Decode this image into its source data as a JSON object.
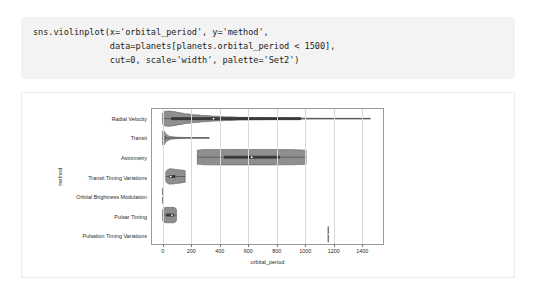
{
  "code_cell": {
    "lines": [
      "sns.violinplot(x='orbital_period', y='method',",
      "               data=planets[planets.orbital_period < 1500],",
      "               cut=0, scale='width', palette='Set2')"
    ]
  },
  "chart_data": {
    "type": "violin",
    "title": "",
    "xlabel": "orbital_period",
    "ylabel": "method",
    "xlim": [
      -75,
      1560
    ],
    "xticks": [
      0,
      200,
      400,
      600,
      800,
      1000,
      1200,
      1400
    ],
    "xtick_labels": [
      "0",
      "200",
      "400",
      "600",
      "800",
      "1000",
      "1200",
      "1400"
    ],
    "grid": "vertical",
    "legend": "none",
    "orientation": "horizontal",
    "scale": "width",
    "cut": 0,
    "palette": "Set2",
    "categories": [
      "Radial Velocity",
      "Transit",
      "Astrometry",
      "Transit Timing Variations",
      "Orbital Brightness Modulation",
      "Pulsar Timing",
      "Pulsation Timing Variations"
    ],
    "violins": [
      {
        "category": "Radial Velocity",
        "color": "#8f8f8f",
        "min": 0,
        "max": 1470,
        "q1": 60,
        "median": 360,
        "q3": 980,
        "profile": [
          [
            0,
            0.72
          ],
          [
            20,
            0.96
          ],
          [
            45,
            1.0
          ],
          [
            80,
            0.92
          ],
          [
            120,
            0.78
          ],
          [
            170,
            0.62
          ],
          [
            230,
            0.5
          ],
          [
            300,
            0.4
          ],
          [
            380,
            0.31
          ],
          [
            470,
            0.23
          ],
          [
            560,
            0.17
          ],
          [
            660,
            0.13
          ],
          [
            780,
            0.1
          ],
          [
            900,
            0.08
          ],
          [
            1040,
            0.06
          ],
          [
            1180,
            0.045
          ],
          [
            1320,
            0.03
          ],
          [
            1400,
            0.022
          ],
          [
            1470,
            0.012
          ]
        ]
      },
      {
        "category": "Transit",
        "color": "#8f8f8f",
        "min": 0,
        "max": 330,
        "q1": 4,
        "median": 9,
        "q3": 22,
        "profile": [
          [
            0,
            0.86
          ],
          [
            5,
            1.0
          ],
          [
            12,
            0.84
          ],
          [
            22,
            0.58
          ],
          [
            34,
            0.36
          ],
          [
            50,
            0.22
          ],
          [
            70,
            0.15
          ],
          [
            100,
            0.1
          ],
          [
            140,
            0.07
          ],
          [
            190,
            0.05
          ],
          [
            250,
            0.035
          ],
          [
            300,
            0.022
          ],
          [
            330,
            0.012
          ]
        ]
      },
      {
        "category": "Astrometry",
        "color": "#8f8f8f",
        "min": 246,
        "max": 1016,
        "q1": 435,
        "median": 631,
        "q3": 830,
        "profile": [
          [
            246,
            0.92
          ],
          [
            300,
            0.99
          ],
          [
            400,
            1.0
          ],
          [
            520,
            1.0
          ],
          [
            650,
            1.0
          ],
          [
            780,
            1.0
          ],
          [
            900,
            0.99
          ],
          [
            980,
            0.95
          ],
          [
            1016,
            0.9
          ]
        ]
      },
      {
        "category": "Transit Timing Variations",
        "color": "#8f8f8f",
        "min": 22,
        "max": 160,
        "q1": 45,
        "median": 57,
        "q3": 90,
        "profile": [
          [
            22,
            0.62
          ],
          [
            35,
            0.88
          ],
          [
            50,
            1.0
          ],
          [
            70,
            0.98
          ],
          [
            95,
            0.92
          ],
          [
            120,
            0.86
          ],
          [
            145,
            0.8
          ],
          [
            160,
            0.76
          ]
        ]
      },
      {
        "category": "Orbital Brightness Modulation",
        "color": "#8f8f8f",
        "min": 0.2,
        "max": 1.5,
        "q1": 0.3,
        "median": 0.35,
        "q3": 1.0,
        "profile": [
          [
            0.2,
            0.9
          ],
          [
            0.6,
            1.0
          ],
          [
            1.1,
            0.95
          ],
          [
            1.5,
            0.85
          ]
        ]
      },
      {
        "category": "Pulsar Timing",
        "color": "#8f8f8f",
        "min": 0.09,
        "max": 98,
        "q1": 25,
        "median": 66,
        "q3": 80,
        "profile": [
          [
            0.09,
            0.7
          ],
          [
            10,
            0.92
          ],
          [
            25,
            1.0
          ],
          [
            45,
            1.0
          ],
          [
            66,
            1.0
          ],
          [
            82,
            0.98
          ],
          [
            92,
            0.9
          ],
          [
            98,
            0.74
          ]
        ]
      },
      {
        "category": "Pulsation Timing Variations",
        "color": "#8f8f8f",
        "min": 1170,
        "max": 1175,
        "q1": 1170,
        "median": 1172,
        "q3": 1175,
        "profile": [
          [
            1170,
            1.0
          ],
          [
            1175,
            1.0
          ]
        ]
      }
    ]
  },
  "colors": {
    "code_bg": "#f3f3f3",
    "code_text": "#1d1d1d",
    "figure_bg": "#ffffff",
    "axes_edge": "#9a9a9a",
    "gridline": "#d9d9d9",
    "violin_fill": "#8f8f8f",
    "violin_edge": "#4a4a4a",
    "box_dark": "#3a3a3a",
    "tick_text": "#2b2b2b"
  }
}
